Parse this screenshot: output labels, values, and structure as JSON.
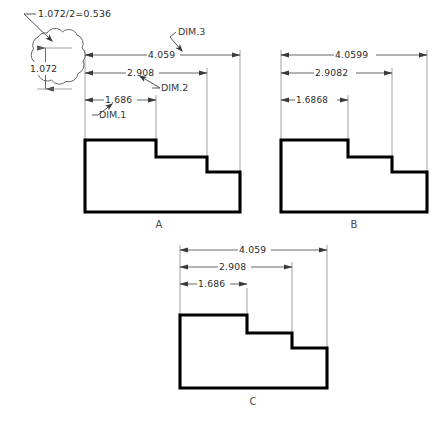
{
  "drawing": {
    "title": "stepped-part-dimension-comparison",
    "note": {
      "text": "1.072/2=0.536",
      "cloud_dimension": "1.072"
    },
    "dim_callouts": [
      {
        "id": "dim3",
        "label": "DIM.3"
      },
      {
        "id": "dim2",
        "label": "DIM.2"
      },
      {
        "id": "dim1",
        "label": "DIM.1"
      }
    ],
    "views": [
      {
        "id": "view-a",
        "label": "A",
        "dimensions": [
          {
            "name": "overall",
            "value": "4.059"
          },
          {
            "name": "second-step",
            "value": "2.908"
          },
          {
            "name": "first-step",
            "value": "1.686"
          }
        ]
      },
      {
        "id": "view-b",
        "label": "B",
        "dimensions": [
          {
            "name": "overall",
            "value": "4.0599"
          },
          {
            "name": "second-step",
            "value": "2.9082"
          },
          {
            "name": "first-step",
            "value": "1.6868"
          }
        ]
      },
      {
        "id": "view-c",
        "label": "C",
        "dimensions": [
          {
            "name": "overall",
            "value": "4.059"
          },
          {
            "name": "second-step",
            "value": "2.908"
          },
          {
            "name": "first-step",
            "value": "1.686"
          }
        ]
      }
    ],
    "colors": {
      "outline": "#000000",
      "dimension_line": "#4d4d4d",
      "extension_line": "#8c8c8c",
      "cloud": "#555555",
      "background": "#ffffff"
    }
  }
}
